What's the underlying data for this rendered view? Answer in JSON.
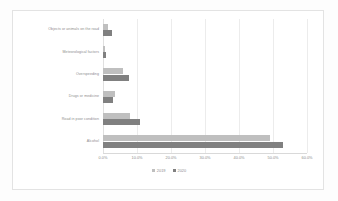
{
  "chart_data": {
    "type": "bar",
    "orientation": "horizontal",
    "title": "",
    "xlabel": "",
    "ylabel": "",
    "xlim": [
      0,
      60
    ],
    "grid": true,
    "legend_position": "bottom",
    "categories": [
      "Objects or animals on the road",
      "Meteorological factors",
      "Overspeeding",
      "Drugs or medicine",
      "Road in poor condition",
      "Alcohol"
    ],
    "xticks": [
      "0.0%",
      "10.0%",
      "20.0%",
      "30.0%",
      "40.0%",
      "50.0%",
      "60.0%"
    ],
    "xtick_values": [
      0,
      10,
      20,
      30,
      40,
      50,
      60
    ],
    "series": [
      {
        "name": "2019",
        "color": "#bfbfbf",
        "values": [
          1.5,
          0.5,
          6.0,
          3.5,
          8.0,
          49.0
        ]
      },
      {
        "name": "2020",
        "color": "#808080",
        "values": [
          2.5,
          0.8,
          7.5,
          3.0,
          11.0,
          53.0
        ]
      }
    ]
  },
  "colors": {
    "series_2019": "#bfbfbf",
    "series_2020": "#808080",
    "gridline": "#ececec",
    "axis": "#d9d9d9",
    "text": "#8d8d8d",
    "panel_background": "#ffffff",
    "figure_background": "#fdfdfd"
  }
}
